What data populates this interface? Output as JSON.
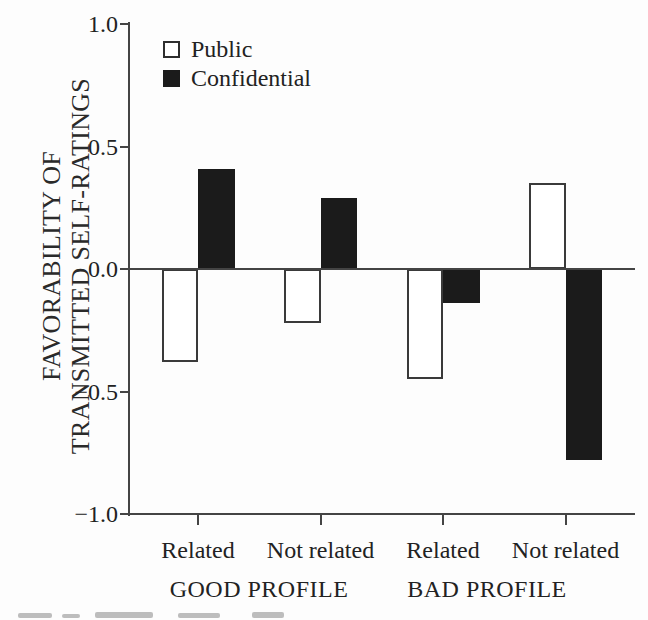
{
  "figure": {
    "background": "#fdfdfd",
    "bar_black": "#1b1b1b",
    "bar_white": "#ffffff",
    "line_color": "#444444",
    "text_color": "#222222"
  },
  "legend": {
    "items": [
      {
        "label": "Public",
        "swatch": "white-outline-square"
      },
      {
        "label": "Confidential",
        "swatch": "black-filled-square"
      }
    ]
  },
  "chart_data": {
    "type": "bar",
    "title": "",
    "xlabel": "",
    "ylabel": "FAVORABILITY OF TRANSMITTED SELF-RATINGS",
    "ylabel_lines": [
      "FAVORABILITY OF",
      "TRANSMITTED SELF-RATINGS"
    ],
    "ylim": [
      -1.0,
      1.0
    ],
    "grid": false,
    "legend_position": "top-left-inside",
    "y_ticks": [
      {
        "value": 1.0,
        "label": "1.0"
      },
      {
        "value": 0.5,
        "label": "0.5"
      },
      {
        "value": 0.0,
        "label": "0.0"
      },
      {
        "value": -0.5,
        "label": "−0.5"
      },
      {
        "value": -1.0,
        "label": "−1.0"
      }
    ],
    "categories": [
      "Related",
      "Not related",
      "Related",
      "Not related"
    ],
    "series": [
      {
        "name": "Public",
        "fill": "#ffffff",
        "values": [
          -0.38,
          -0.22,
          -0.45,
          0.35
        ]
      },
      {
        "name": "Confidential",
        "fill": "#1b1b1b",
        "values": [
          0.41,
          0.29,
          -0.14,
          -0.78
        ]
      }
    ],
    "group_labels": [
      {
        "label": "GOOD PROFILE",
        "category_indexes": [
          0,
          1
        ]
      },
      {
        "label": "BAD PROFILE",
        "category_indexes": [
          2,
          3
        ]
      }
    ]
  }
}
